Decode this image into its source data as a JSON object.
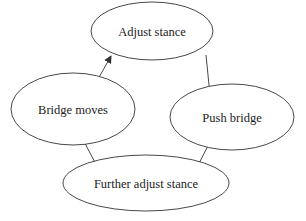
{
  "diagram": {
    "type": "cycle",
    "nodes": [
      {
        "id": "adjust",
        "label": "Adjust stance",
        "cx": 152,
        "cy": 31,
        "rx": 61,
        "ry": 29
      },
      {
        "id": "push",
        "label": "Push bridge",
        "cx": 232,
        "cy": 117,
        "rx": 62,
        "ry": 33
      },
      {
        "id": "further",
        "label": "Further adjust stance",
        "cx": 146,
        "cy": 183,
        "rx": 83,
        "ry": 28
      },
      {
        "id": "moves",
        "label": "Bridge moves",
        "cx": 73,
        "cy": 109,
        "rx": 62,
        "ry": 36
      }
    ],
    "edges": [
      {
        "from": "adjust",
        "to": "push"
      },
      {
        "from": "push",
        "to": "further"
      },
      {
        "from": "further",
        "to": "moves"
      },
      {
        "from": "moves",
        "to": "adjust"
      }
    ],
    "colors": {
      "stroke": "#333333",
      "text": "#222222",
      "background": "#ffffff"
    }
  }
}
